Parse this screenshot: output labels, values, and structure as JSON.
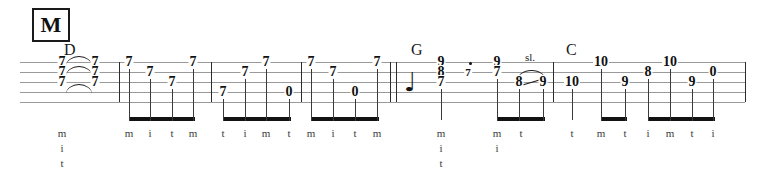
{
  "sheet": {
    "kind": "banjo-tablature",
    "rehearsal_mark": "M",
    "width": 761,
    "height": 177,
    "string_count": 5,
    "colors": {
      "ink": "#111111",
      "staff_line": "#9a9a9a",
      "beam": "#121212",
      "fingering": "#3a3a3a"
    }
  },
  "chords": [
    {
      "label": "D",
      "x": 64,
      "y": 42
    },
    {
      "label": "G",
      "x": 411,
      "y": 42
    },
    {
      "label": "C",
      "x": 566,
      "y": 42
    }
  ],
  "staff": {
    "x_start": 20,
    "x_end": 745,
    "line_ys": [
      62,
      72,
      82,
      92,
      102
    ]
  },
  "barlines": [
    {
      "x": 119,
      "type": "thin"
    },
    {
      "x": 211,
      "type": "thin"
    },
    {
      "x": 301,
      "type": "thin"
    },
    {
      "x": 390,
      "type": "thin"
    },
    {
      "x": 396,
      "type": "thin"
    },
    {
      "x": 553,
      "type": "thin"
    },
    {
      "x": 745,
      "type": "thin"
    }
  ],
  "notes": [
    {
      "fret": "7",
      "string": 1,
      "x": 62,
      "stem": false
    },
    {
      "fret": "7",
      "string": 2,
      "x": 62,
      "stem": false
    },
    {
      "fret": "7",
      "string": 3,
      "x": 62,
      "stem": false
    },
    {
      "fret": "7",
      "string": 1,
      "x": 95,
      "stem": false
    },
    {
      "fret": "7",
      "string": 2,
      "x": 95,
      "stem": false
    },
    {
      "fret": "7",
      "string": 3,
      "x": 95,
      "stem": false
    },
    {
      "fret": "7",
      "string": 1,
      "x": 129,
      "stem": true
    },
    {
      "fret": "7",
      "string": 2,
      "x": 150,
      "stem": true
    },
    {
      "fret": "7",
      "string": 3,
      "x": 172,
      "stem": true
    },
    {
      "fret": "7",
      "string": 1,
      "x": 193,
      "stem": true
    },
    {
      "fret": "7",
      "string": 4,
      "x": 223,
      "stem": true
    },
    {
      "fret": "7",
      "string": 2,
      "x": 245,
      "stem": true
    },
    {
      "fret": "7",
      "string": 1,
      "x": 266,
      "stem": true
    },
    {
      "fret": "0",
      "string": 4,
      "x": 289,
      "stem": true
    },
    {
      "fret": "7",
      "string": 1,
      "x": 311,
      "stem": true
    },
    {
      "fret": "7",
      "string": 2,
      "x": 333,
      "stem": true
    },
    {
      "fret": "0",
      "string": 4,
      "x": 355,
      "stem": true
    },
    {
      "fret": "7",
      "string": 1,
      "x": 377,
      "stem": true
    },
    {
      "fret": "9",
      "string": 1,
      "x": 441,
      "stem": true
    },
    {
      "fret": "8",
      "string": 2,
      "x": 441,
      "stem": true
    },
    {
      "fret": "7",
      "string": 3,
      "x": 441,
      "stem": true
    },
    {
      "fret": "7",
      "string": 2,
      "x": 468,
      "stem": false,
      "size": "small",
      "dotted": true
    },
    {
      "fret": "9",
      "string": 1,
      "x": 497,
      "stem": true
    },
    {
      "fret": "7",
      "string": 2,
      "x": 497,
      "stem": true
    },
    {
      "fret": "8",
      "string": 3,
      "x": 519,
      "stem": true
    },
    {
      "fret": "9",
      "string": 3,
      "x": 543,
      "stem": true
    },
    {
      "fret": "10",
      "string": 3,
      "x": 572,
      "stem": true
    },
    {
      "fret": "10",
      "string": 1,
      "x": 601,
      "stem": true
    },
    {
      "fret": "9",
      "string": 3,
      "x": 625,
      "stem": true
    },
    {
      "fret": "8",
      "string": 2,
      "x": 648,
      "stem": true
    },
    {
      "fret": "10",
      "string": 1,
      "x": 670,
      "stem": true
    },
    {
      "fret": "9",
      "string": 3,
      "x": 692,
      "stem": true
    },
    {
      "fret": "0",
      "string": 2,
      "x": 713,
      "stem": true
    }
  ],
  "beams": [
    {
      "x_start": 129,
      "x_end": 195,
      "y": 117
    },
    {
      "x_start": 223,
      "x_end": 291,
      "y": 117
    },
    {
      "x_start": 311,
      "x_end": 379,
      "y": 117
    },
    {
      "x_start": 497,
      "x_end": 545,
      "y": 117
    },
    {
      "x_start": 601,
      "x_end": 627,
      "y": 117
    },
    {
      "x_start": 648,
      "x_end": 715,
      "y": 117
    }
  ],
  "ties": [
    {
      "x_start": 66,
      "x_end": 92,
      "y": 56
    },
    {
      "x_start": 66,
      "x_end": 92,
      "y": 66
    },
    {
      "x_start": 66,
      "x_end": 92,
      "y": 84
    }
  ],
  "techniques": [
    {
      "label": "sl.",
      "x": 530,
      "y": 52,
      "from_x": 521,
      "from_y": 85,
      "to_x": 541,
      "to_y": 79,
      "slur_x_start": 517,
      "slur_x_end": 546,
      "slur_y": 70
    }
  ],
  "rests": [
    {
      "type": "quarter",
      "glyph": "♩",
      "x": 410,
      "y": 82
    }
  ],
  "fingerings": [
    {
      "x": 62,
      "y": 126,
      "letters": [
        "m",
        "i",
        "t"
      ],
      "stacked": true
    },
    {
      "x": 129,
      "y": 126,
      "letters": [
        "m"
      ],
      "stacked": false
    },
    {
      "x": 150,
      "y": 126,
      "letters": [
        "i"
      ],
      "stacked": false
    },
    {
      "x": 172,
      "y": 126,
      "letters": [
        "t"
      ],
      "stacked": false
    },
    {
      "x": 193,
      "y": 126,
      "letters": [
        "m"
      ],
      "stacked": false
    },
    {
      "x": 223,
      "y": 126,
      "letters": [
        "t"
      ],
      "stacked": false
    },
    {
      "x": 245,
      "y": 126,
      "letters": [
        "i"
      ],
      "stacked": false
    },
    {
      "x": 266,
      "y": 126,
      "letters": [
        "m"
      ],
      "stacked": false
    },
    {
      "x": 289,
      "y": 126,
      "letters": [
        "t"
      ],
      "stacked": false
    },
    {
      "x": 311,
      "y": 126,
      "letters": [
        "m"
      ],
      "stacked": false
    },
    {
      "x": 333,
      "y": 126,
      "letters": [
        "i"
      ],
      "stacked": false
    },
    {
      "x": 355,
      "y": 126,
      "letters": [
        "t"
      ],
      "stacked": false
    },
    {
      "x": 377,
      "y": 126,
      "letters": [
        "m"
      ],
      "stacked": false
    },
    {
      "x": 441,
      "y": 126,
      "letters": [
        "m",
        "i",
        "t"
      ],
      "stacked": true
    },
    {
      "x": 497,
      "y": 126,
      "letters": [
        "m",
        "i"
      ],
      "stacked": true
    },
    {
      "x": 521,
      "y": 126,
      "letters": [
        "t"
      ],
      "stacked": false
    },
    {
      "x": 572,
      "y": 126,
      "letters": [
        "t"
      ],
      "stacked": false
    },
    {
      "x": 601,
      "y": 126,
      "letters": [
        "m"
      ],
      "stacked": false
    },
    {
      "x": 625,
      "y": 126,
      "letters": [
        "t"
      ],
      "stacked": false
    },
    {
      "x": 648,
      "y": 126,
      "letters": [
        "i"
      ],
      "stacked": false
    },
    {
      "x": 670,
      "y": 126,
      "letters": [
        "m"
      ],
      "stacked": false
    },
    {
      "x": 692,
      "y": 126,
      "letters": [
        "t"
      ],
      "stacked": false
    },
    {
      "x": 713,
      "y": 126,
      "letters": [
        "i"
      ],
      "stacked": false
    }
  ],
  "rehearsal": {
    "x": 32,
    "y": 8,
    "width": 34,
    "height": 30,
    "font_size": 22
  }
}
